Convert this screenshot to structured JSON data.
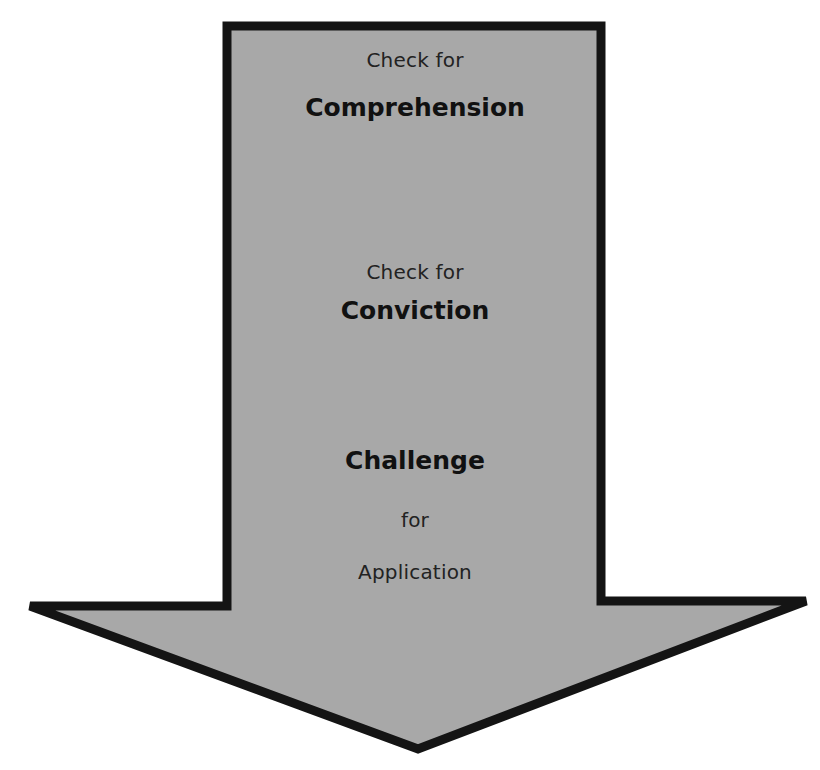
{
  "diagram": {
    "type": "downward-arrow",
    "colors": {
      "fill": "#a8a8a8",
      "stroke": "#141414",
      "background": "#ffffff"
    },
    "steps": [
      {
        "prefix": "Check for",
        "keyword": "Comprehension"
      },
      {
        "prefix": "Check for",
        "keyword": "Conviction"
      },
      {
        "keyword": "Challenge",
        "connector": "for",
        "suffix": "Application"
      }
    ]
  }
}
